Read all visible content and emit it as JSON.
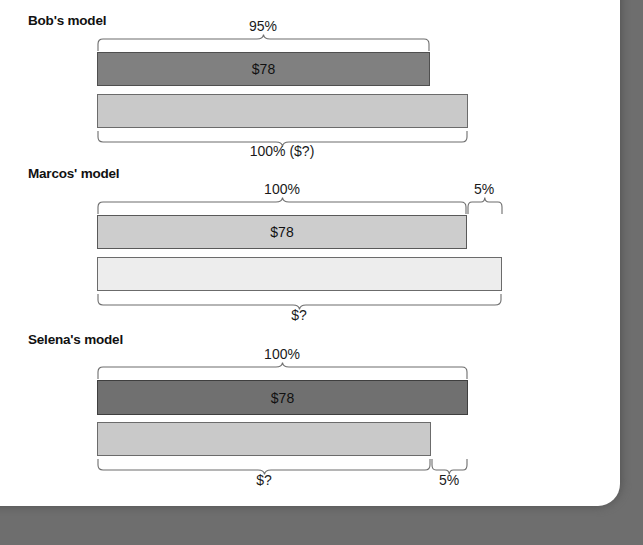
{
  "page": {
    "background_color": "#6e6e6e",
    "paper_color": "#ffffff"
  },
  "diagram": {
    "type": "bar-comparison-models",
    "title_visible": false,
    "sections": [
      {
        "id": "bobs-model",
        "heading": "Bob's model",
        "bars": [
          {
            "id": "bob-top-bar",
            "label": "$78",
            "fill": "#808080",
            "stroke": "#4f4f4f",
            "left_px": 97,
            "right_px": 429
          },
          {
            "id": "bob-bottom-bar",
            "label": "",
            "fill": "#c9c9c9",
            "stroke": "#6b6b6b",
            "left_px": 97,
            "right_px": 467
          }
        ],
        "braces": [
          {
            "id": "bob-top-brace",
            "position": "above",
            "label": "95%",
            "left_px": 97,
            "right_px": 429
          },
          {
            "id": "bob-bottom-brace",
            "position": "below",
            "label": "100% ($?)",
            "left_px": 97,
            "right_px": 467
          }
        ]
      },
      {
        "id": "marcos-model",
        "heading": "Marcos' model",
        "bars": [
          {
            "id": "marcos-top-bar",
            "label": "$78",
            "fill": "#cdcdcd",
            "stroke": "#595959",
            "left_px": 97,
            "right_px": 466
          },
          {
            "id": "marcos-bottom-bar",
            "label": "",
            "fill": "#ededed",
            "stroke": "#6b6b6b",
            "left_px": 97,
            "right_px": 501
          }
        ],
        "braces": [
          {
            "id": "marcos-top-brace-100",
            "position": "above",
            "label": "100%",
            "left_px": 97,
            "right_px": 466
          },
          {
            "id": "marcos-top-brace-5",
            "position": "above",
            "label": "5%",
            "left_px": 466,
            "right_px": 502
          },
          {
            "id": "marcos-bottom-brace",
            "position": "below",
            "label": "$?",
            "left_px": 97,
            "right_px": 501
          }
        ]
      },
      {
        "id": "selena-model",
        "heading": "Selena's model",
        "bars": [
          {
            "id": "selena-top-bar",
            "label": "$78",
            "fill": "#707070",
            "stroke": "#3f3f3f",
            "left_px": 97,
            "right_px": 467
          },
          {
            "id": "selena-bottom-bar",
            "label": "",
            "fill": "#c9c9c9",
            "stroke": "#6b6b6b",
            "left_px": 97,
            "right_px": 430
          }
        ],
        "braces": [
          {
            "id": "selena-top-brace",
            "position": "above",
            "label": "100%",
            "left_px": 97,
            "right_px": 467
          },
          {
            "id": "selena-bottom-brace-q",
            "position": "below",
            "label": "$?",
            "left_px": 97,
            "right_px": 430
          },
          {
            "id": "selena-bottom-brace-5",
            "position": "below",
            "label": "5%",
            "left_px": 430,
            "right_px": 467
          }
        ]
      }
    ]
  }
}
